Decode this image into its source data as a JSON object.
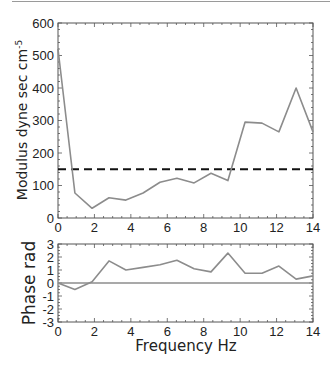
{
  "chart_data": [
    {
      "type": "line",
      "panel": "top",
      "title": "",
      "xlabel": "",
      "ylabel": "Modulus dyne sec cm",
      "ylabel_superscript": "-5",
      "xlim": [
        0,
        14
      ],
      "ylim": [
        0,
        600
      ],
      "xticks": [
        0,
        2,
        4,
        6,
        8,
        10,
        12,
        14
      ],
      "yticks": [
        0,
        100,
        200,
        300,
        400,
        500,
        600
      ],
      "grid": false,
      "series": [
        {
          "name": "Modulus",
          "color": "#8c8c8c",
          "style": "solid",
          "x": [
            0,
            0.93,
            1.87,
            2.8,
            3.73,
            4.67,
            5.6,
            6.53,
            7.47,
            8.4,
            9.33,
            10.27,
            11.2,
            12.13,
            13.07,
            14
          ],
          "y": [
            520,
            77,
            30,
            62,
            55,
            77,
            110,
            122,
            108,
            138,
            115,
            295,
            292,
            265,
            400,
            265
          ]
        },
        {
          "name": "Reference level",
          "color": "#111111",
          "style": "dashed",
          "x": [
            0,
            14
          ],
          "y": [
            150,
            150
          ]
        }
      ]
    },
    {
      "type": "line",
      "panel": "bottom",
      "title": "",
      "xlabel": "Frequency Hz",
      "ylabel": "Phase rad",
      "xlim": [
        0,
        14
      ],
      "ylim": [
        -3,
        3
      ],
      "xticks": [
        0,
        2,
        4,
        6,
        8,
        10,
        12,
        14
      ],
      "yticks": [
        3,
        2,
        1,
        0,
        -1,
        -2,
        -3
      ],
      "grid": false,
      "series": [
        {
          "name": "Phase",
          "color": "#8c8c8c",
          "style": "solid",
          "x": [
            0,
            0.93,
            1.87,
            2.8,
            3.73,
            4.67,
            5.6,
            6.53,
            7.47,
            8.4,
            9.33,
            10.27,
            11.2,
            12.13,
            13.07,
            14
          ],
          "y": [
            0,
            -0.5,
            0.1,
            1.7,
            1.0,
            1.2,
            1.4,
            1.75,
            1.1,
            0.85,
            2.3,
            0.75,
            0.75,
            1.3,
            0.3,
            0.55
          ]
        },
        {
          "name": "Zero line",
          "color": "#8c8c8c",
          "style": "solid",
          "x": [
            0,
            14
          ],
          "y": [
            0,
            0
          ]
        }
      ]
    }
  ]
}
